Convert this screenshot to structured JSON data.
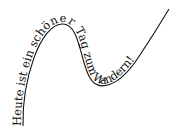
{
  "figure": {
    "text": "Heute ist ein schöner Tag zum Wandern!",
    "text_color": "#111111",
    "line_color": "#111111",
    "background": "#ffffff"
  }
}
